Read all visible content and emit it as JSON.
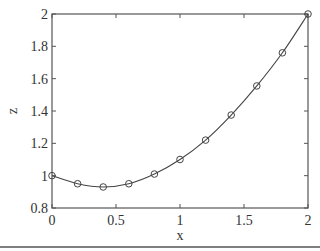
{
  "chart_data": {
    "type": "line",
    "title": "",
    "xlabel": "x",
    "ylabel": "z",
    "xlim": [
      0,
      2
    ],
    "ylim": [
      0.8,
      2
    ],
    "grid": false,
    "legend": null,
    "box": true,
    "x_ticks": [
      0,
      0.5,
      1,
      1.5,
      2
    ],
    "x_tick_labels": [
      "0",
      "0.5",
      "1",
      "1.5",
      "2"
    ],
    "y_ticks": [
      0.8,
      1,
      1.2,
      1.4,
      1.6,
      1.8,
      2
    ],
    "y_tick_labels": [
      "0.8",
      "1",
      "1.2",
      "1.4",
      "1.6",
      "1.8",
      "2"
    ],
    "series": [
      {
        "name": "z(x)",
        "style": "solid line with circle markers",
        "color": "#444444",
        "x": [
          0,
          0.2,
          0.4,
          0.6,
          0.8,
          1.0,
          1.2,
          1.4,
          1.6,
          1.8,
          2.0
        ],
        "values": [
          1.0,
          0.95,
          0.93,
          0.95,
          1.01,
          1.1,
          1.22,
          1.375,
          1.555,
          1.76,
          2.0
        ]
      }
    ]
  },
  "labels": {
    "xlabel": "x",
    "ylabel": "z"
  },
  "colors": {
    "axis": "#555555",
    "line": "#444444",
    "text": "#333333",
    "background": "#ffffff"
  }
}
